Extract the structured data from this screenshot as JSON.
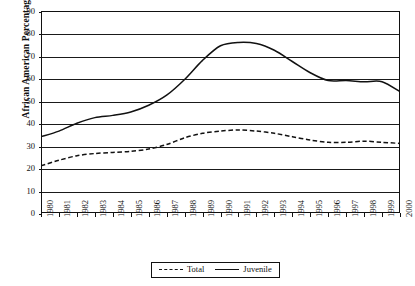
{
  "chart_data": {
    "type": "line",
    "title": "",
    "xlabel": "",
    "ylabel": "African American Percentage",
    "ylim": [
      0,
      90
    ],
    "yticks": [
      0,
      10,
      20,
      30,
      40,
      50,
      60,
      70,
      80,
      90
    ],
    "grid": true,
    "legend_position": "bottom-center",
    "categories": [
      "1980",
      "1981",
      "1982",
      "1983",
      "1984",
      "1985",
      "1986",
      "1987",
      "1988",
      "1989",
      "1990",
      "1991",
      "1992",
      "1993",
      "1994",
      "1995",
      "1996",
      "1997",
      "1998",
      "1999",
      "2000"
    ],
    "series": [
      {
        "name": "Total",
        "style": "dashed",
        "color": "#111111",
        "values": [
          21,
          23.5,
          25.5,
          26.5,
          27,
          27.5,
          28.5,
          30.5,
          33.5,
          35.5,
          36.5,
          37,
          36.5,
          35.5,
          34,
          32.5,
          31.5,
          31.5,
          32,
          31.5,
          31
        ]
      },
      {
        "name": "Juvenile",
        "style": "solid",
        "color": "#111111",
        "values": [
          34,
          36.5,
          40,
          42.5,
          43.5,
          45,
          48,
          52.5,
          59.5,
          68,
          74.5,
          76,
          75.5,
          72.5,
          67.5,
          62.5,
          59,
          59,
          58.5,
          58.5,
          54
        ]
      }
    ]
  },
  "legend": {
    "items": [
      {
        "label": "Total",
        "style": "dashed"
      },
      {
        "label": "Juvenile",
        "style": "solid"
      }
    ]
  }
}
